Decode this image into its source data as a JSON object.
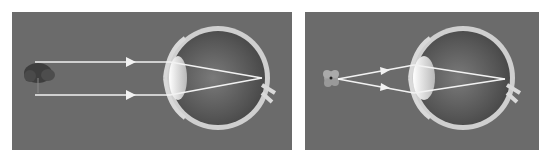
{
  "figure": {
    "panels": [
      {
        "id": "distant-object",
        "object": "tree",
        "rays": "parallel",
        "focus": "retina"
      },
      {
        "id": "near-object",
        "object": "flower",
        "rays": "diverging",
        "focus": "retina"
      }
    ],
    "colors": {
      "background": "#6b6b6b",
      "ray": "#f2f2f2",
      "sclera": "#d9d9d9",
      "eye_interior": "#5a5a5a",
      "lens": "#e8e8e8"
    }
  }
}
